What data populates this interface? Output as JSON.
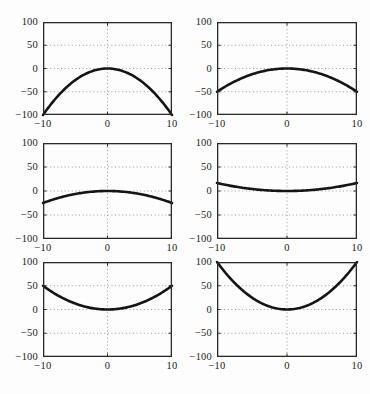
{
  "figure": {
    "background": "#fdfdfd",
    "colors": {
      "curve": "#151515",
      "frame": "#2a2a2a",
      "grid": "#9b9b9b",
      "label": "#1c1c1c"
    }
  },
  "chart_data": [
    {
      "id": "top-left",
      "type": "line",
      "coefficient": -1,
      "xlim": [
        -10,
        10
      ],
      "ylim": [
        -100,
        100
      ],
      "xticks": [
        -10,
        0,
        10
      ],
      "yticks": [
        100,
        50,
        0,
        -50,
        -100
      ],
      "xtick_labels": [
        "−10",
        "0",
        "10"
      ],
      "ytick_labels": [
        "100",
        "50",
        "0",
        "−50",
        "−100"
      ],
      "grid": "dotted",
      "legend": "none",
      "x": [
        -10,
        -8,
        -6,
        -4,
        -2,
        0,
        2,
        4,
        6,
        8,
        10
      ],
      "y": [
        -100,
        -64,
        -36,
        -16,
        -4,
        0,
        -4,
        -16,
        -36,
        -64,
        -100
      ]
    },
    {
      "id": "top-right",
      "type": "line",
      "coefficient": -0.5,
      "xlim": [
        -10,
        10
      ],
      "ylim": [
        -100,
        100
      ],
      "xticks": [
        -10,
        0,
        10
      ],
      "yticks": [
        100,
        50,
        0,
        -50,
        -100
      ],
      "xtick_labels": [
        "−10",
        "0",
        "10"
      ],
      "ytick_labels": [
        "100",
        "50",
        "0",
        "−50",
        "−100"
      ],
      "grid": "dotted",
      "legend": "none",
      "x": [
        -10,
        -8,
        -6,
        -4,
        -2,
        0,
        2,
        4,
        6,
        8,
        10
      ],
      "y": [
        -50,
        -32,
        -18,
        -8,
        -2,
        0,
        -2,
        -8,
        -18,
        -32,
        -50
      ]
    },
    {
      "id": "middle-left",
      "type": "line",
      "coefficient": -0.25,
      "xlim": [
        -10,
        10
      ],
      "ylim": [
        -100,
        100
      ],
      "xticks": [
        -10,
        0,
        10
      ],
      "yticks": [
        100,
        50,
        0,
        -50,
        -100
      ],
      "xtick_labels": [
        "−10",
        "0",
        "10"
      ],
      "ytick_labels": [
        "100",
        "50",
        "0",
        "−50",
        "−100"
      ],
      "grid": "dotted",
      "legend": "none",
      "x": [
        -10,
        -8,
        -6,
        -4,
        -2,
        0,
        2,
        4,
        6,
        8,
        10
      ],
      "y": [
        -25,
        -16,
        -9,
        -4,
        -1,
        0,
        -1,
        -4,
        -9,
        -16,
        -25
      ]
    },
    {
      "id": "middle-right",
      "type": "line",
      "coefficient": 0.167,
      "xlim": [
        -10,
        10
      ],
      "ylim": [
        -100,
        100
      ],
      "xticks": [
        -10,
        0,
        10
      ],
      "yticks": [
        100,
        50,
        0,
        -50,
        -100
      ],
      "xtick_labels": [
        "−10",
        "0",
        "10"
      ],
      "ytick_labels": [
        "100",
        "50",
        "0",
        "−50",
        "−100"
      ],
      "grid": "dotted",
      "legend": "none",
      "x": [
        -10,
        -8,
        -6,
        -4,
        -2,
        0,
        2,
        4,
        6,
        8,
        10
      ],
      "y": [
        16.7,
        10.7,
        6,
        2.7,
        0.7,
        0,
        0.7,
        2.7,
        6,
        10.7,
        16.7
      ]
    },
    {
      "id": "bottom-left",
      "type": "line",
      "coefficient": 0.5,
      "xlim": [
        -10,
        10
      ],
      "ylim": [
        -100,
        100
      ],
      "xticks": [
        -10,
        0,
        10
      ],
      "yticks": [
        100,
        50,
        0,
        -50,
        -100
      ],
      "xtick_labels": [
        "−10",
        "0",
        "10"
      ],
      "ytick_labels": [
        "100",
        "50",
        "0",
        "−50",
        "−100"
      ],
      "grid": "dotted",
      "legend": "none",
      "x": [
        -10,
        -8,
        -6,
        -4,
        -2,
        0,
        2,
        4,
        6,
        8,
        10
      ],
      "y": [
        50,
        32,
        18,
        8,
        2,
        0,
        2,
        8,
        18,
        32,
        50
      ]
    },
    {
      "id": "bottom-right",
      "type": "line",
      "coefficient": 1,
      "xlim": [
        -10,
        10
      ],
      "ylim": [
        -100,
        100
      ],
      "xticks": [
        -10,
        0,
        10
      ],
      "yticks": [
        100,
        50,
        0,
        -50,
        -100
      ],
      "xtick_labels": [
        "−10",
        "0",
        "10"
      ],
      "ytick_labels": [
        "100",
        "50",
        "0",
        "−50",
        "−100"
      ],
      "grid": "dotted",
      "legend": "none",
      "x": [
        -10,
        -8,
        -6,
        -4,
        -2,
        0,
        2,
        4,
        6,
        8,
        10
      ],
      "y": [
        100,
        64,
        36,
        16,
        4,
        0,
        4,
        16,
        36,
        64,
        100
      ]
    }
  ]
}
